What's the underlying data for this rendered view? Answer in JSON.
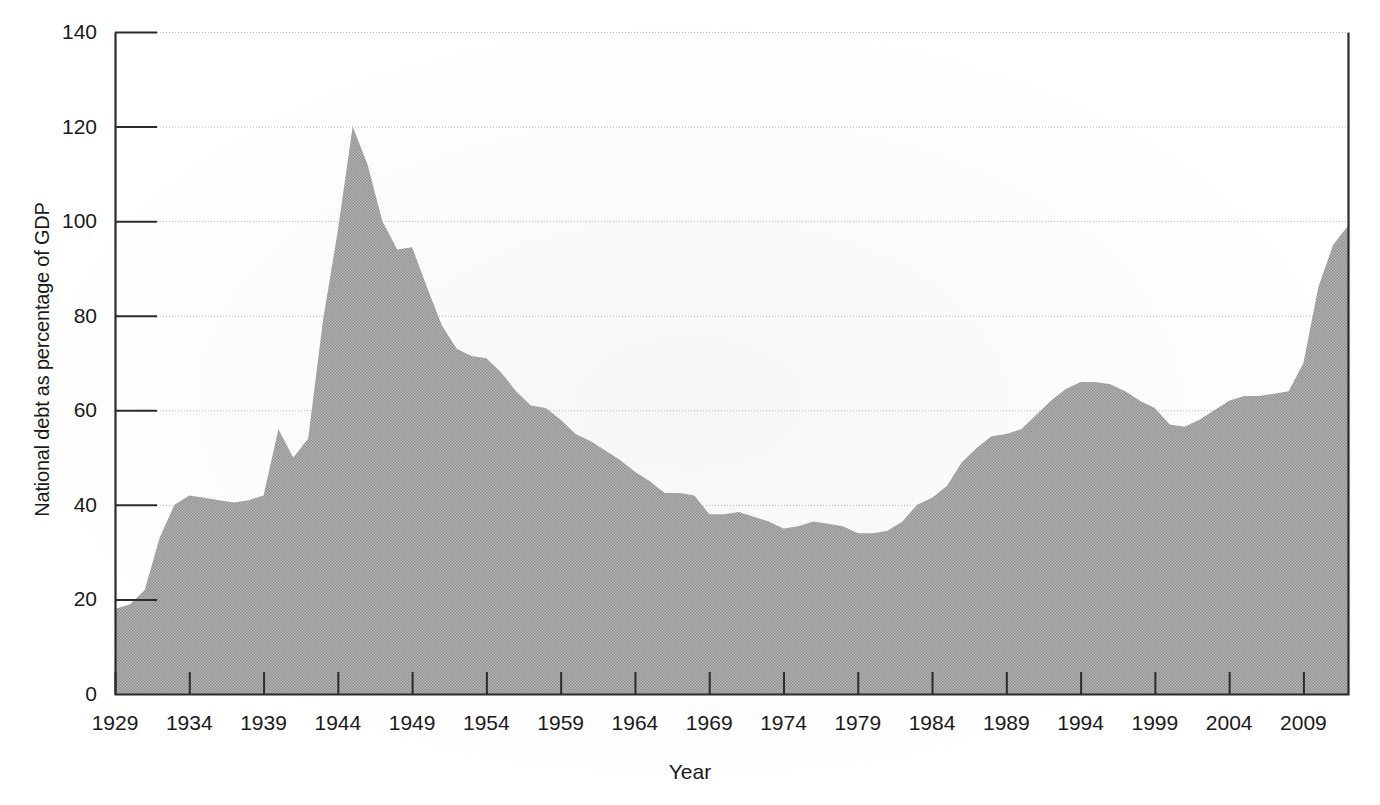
{
  "chart_data": {
    "type": "area",
    "title": "",
    "xlabel": "Year",
    "ylabel": "National debt as percentage of GDP",
    "xlim": [
      1929,
      2012
    ],
    "ylim": [
      0,
      140
    ],
    "yticks": [
      0,
      20,
      40,
      60,
      80,
      100,
      120,
      140
    ],
    "ytick_labels": [
      "0",
      "20",
      "40",
      "60",
      "80",
      "100",
      "120",
      "140"
    ],
    "xticks": [
      1929,
      1934,
      1939,
      1944,
      1949,
      1954,
      1959,
      1964,
      1969,
      1974,
      1979,
      1984,
      1989,
      1994,
      1999,
      2004,
      2009
    ],
    "xtick_labels": [
      "1929",
      "1934",
      "1939",
      "1944",
      "1949",
      "1954",
      "1959",
      "1964",
      "1969",
      "1974",
      "1979",
      "1984",
      "1989",
      "1994",
      "1999",
      "2004",
      "2009"
    ],
    "grid": true,
    "legend": "none",
    "series_name": "National debt as percentage of GDP",
    "fill_color": "#a3a3a3",
    "axis_color": "#2b2b2b",
    "grid_color": "#b4b4b4",
    "x": [
      1929,
      1930,
      1931,
      1932,
      1933,
      1934,
      1935,
      1936,
      1937,
      1938,
      1939,
      1940,
      1941,
      1942,
      1943,
      1944,
      1945,
      1946,
      1947,
      1948,
      1949,
      1950,
      1951,
      1952,
      1953,
      1954,
      1955,
      1956,
      1957,
      1958,
      1959,
      1960,
      1961,
      1962,
      1963,
      1964,
      1965,
      1966,
      1967,
      1968,
      1969,
      1970,
      1971,
      1972,
      1973,
      1974,
      1975,
      1976,
      1977,
      1978,
      1979,
      1980,
      1981,
      1982,
      1983,
      1984,
      1985,
      1986,
      1987,
      1988,
      1989,
      1990,
      1991,
      1992,
      1993,
      1994,
      1995,
      1996,
      1997,
      1998,
      1999,
      2000,
      2001,
      2002,
      2003,
      2004,
      2005,
      2006,
      2007,
      2008,
      2009,
      2010,
      2011,
      2012
    ],
    "y": [
      18,
      19,
      22,
      33,
      40,
      42,
      41.5,
      41,
      40.5,
      41,
      42,
      56,
      50,
      54,
      79,
      98,
      120,
      112,
      100,
      94,
      94.5,
      86,
      78,
      73,
      71.5,
      71,
      68,
      64,
      61,
      60.5,
      58,
      55,
      53.5,
      51.5,
      49.5,
      47,
      45,
      42.5,
      42.5,
      42,
      38,
      38,
      38.5,
      37.5,
      36.5,
      35,
      35.5,
      36.5,
      36,
      35.5,
      34,
      34,
      34.5,
      36.5,
      40,
      41.5,
      44,
      49,
      52,
      54.5,
      55,
      56,
      59,
      62,
      64.5,
      66,
      66,
      65.5,
      64,
      62,
      60.5,
      57,
      56.5,
      58,
      60,
      62,
      63,
      63,
      63.5,
      64,
      70,
      86,
      95,
      99,
      102
    ],
    "annotations": []
  },
  "units": {
    "y_unit": "percent",
    "x_unit": "year"
  }
}
